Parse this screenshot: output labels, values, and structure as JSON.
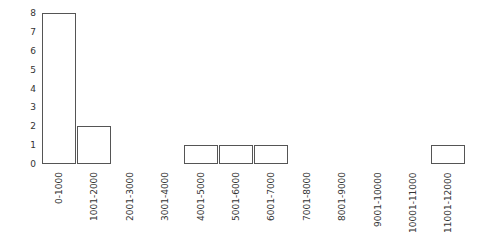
{
  "chart_data": {
    "type": "bar",
    "title": "",
    "xlabel": "",
    "ylabel": "",
    "categories": [
      "0-1000",
      "1001-2000",
      "2001-3000",
      "3001-4000",
      "4001-5000",
      "5001-6000",
      "6001-7000",
      "7001-8000",
      "8001-9000",
      "9001-10000",
      "10001-11000",
      "11001-12000"
    ],
    "values": [
      8,
      2,
      0,
      0,
      1,
      1,
      1,
      0,
      0,
      0,
      0,
      1
    ],
    "yticks": [
      0,
      1,
      2,
      3,
      4,
      5,
      6,
      7,
      8
    ],
    "ylim": [
      0,
      8
    ],
    "grid": false,
    "legend": null,
    "colors": {
      "bar_fill": "#ffffff",
      "bar_stroke": "#555555",
      "text": "#333333"
    }
  }
}
